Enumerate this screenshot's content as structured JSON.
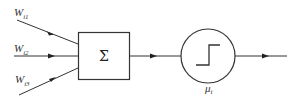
{
  "diagram": {
    "title": "",
    "inputs": [
      {
        "label": "W",
        "subscript": "i1"
      },
      {
        "label": "W",
        "subscript": "i2"
      },
      {
        "label": "W",
        "subscript": "i3"
      }
    ],
    "summation": {
      "symbol": "Σ"
    },
    "activation": {
      "label": "μ",
      "subscript": "i",
      "shape": "step-function"
    },
    "colors": {
      "stroke": "#333333",
      "background": "#ffffff"
    }
  }
}
